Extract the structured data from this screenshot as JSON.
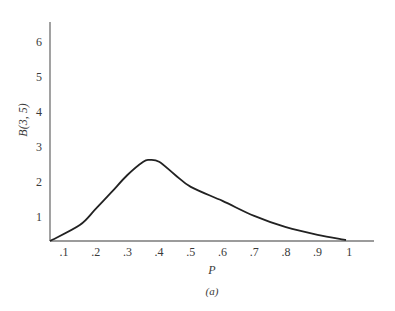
{
  "chart_data": {
    "type": "line",
    "title": "",
    "caption": "(a)",
    "xlabel": "P",
    "ylabel": "B(3, 5)",
    "x_ticks": [
      ".1",
      ".2",
      ".3",
      ".4",
      ".5",
      ".6",
      ".7",
      ".8",
      ".9",
      "1"
    ],
    "x_tick_values": [
      0.1,
      0.2,
      0.3,
      0.4,
      0.5,
      0.6,
      0.7,
      0.8,
      0.9,
      1.0
    ],
    "y_ticks": [
      "1",
      "2",
      "3",
      "4",
      "5",
      "6"
    ],
    "y_tick_values": [
      1,
      2,
      3,
      4,
      5,
      6
    ],
    "xlim": [
      0.05,
      1.1
    ],
    "ylim": [
      0.3,
      6.5
    ],
    "grid": false,
    "legend": null,
    "series": [
      {
        "name": "B(3, 5)",
        "x": [
          0.056,
          0.15,
          0.2,
          0.25,
          0.3,
          0.35,
          0.37,
          0.4,
          0.45,
          0.5,
          0.6,
          0.7,
          0.8,
          0.9,
          0.99
        ],
        "y": [
          0.3,
          0.77,
          1.23,
          1.71,
          2.2,
          2.58,
          2.63,
          2.58,
          2.21,
          1.86,
          1.46,
          1.03,
          0.71,
          0.49,
          0.34
        ]
      }
    ]
  },
  "colors": {
    "axis": "#7a7a7a",
    "curve": "#222222",
    "text": "#3a3a3a"
  }
}
